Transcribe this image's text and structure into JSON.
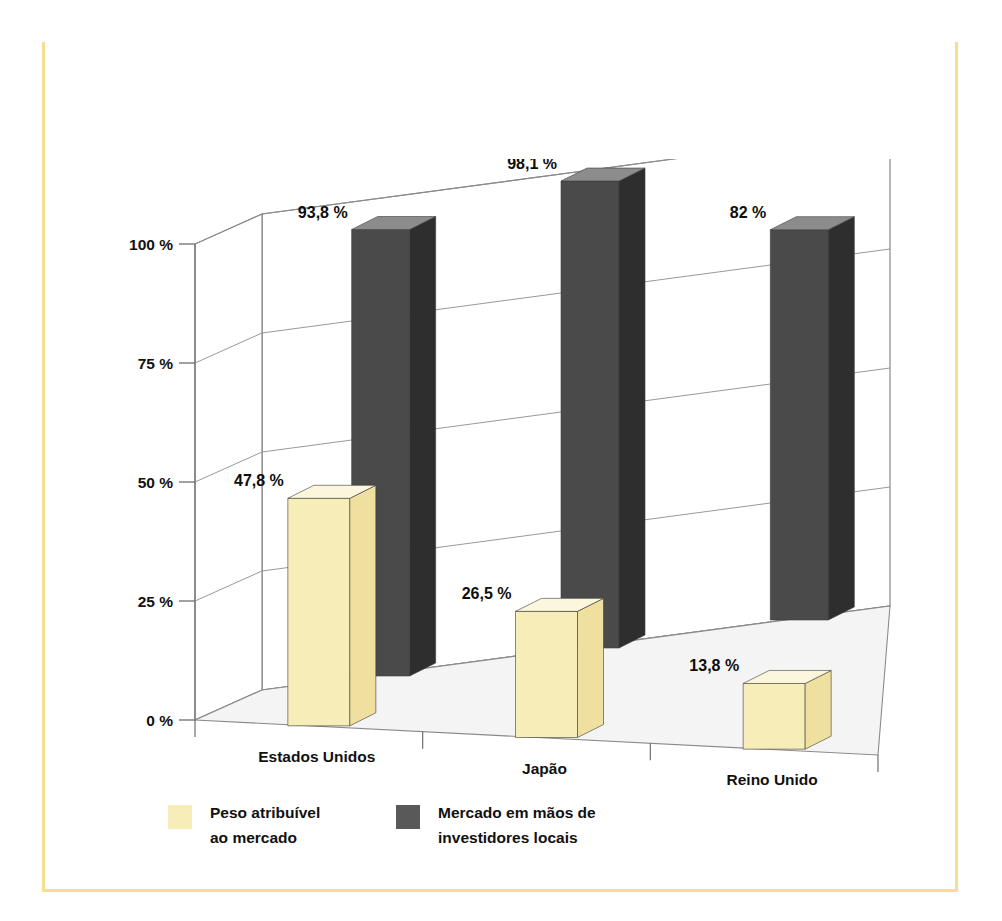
{
  "figure": {
    "caption_line1": "Figura 7.2 – Peso atribuível ao mercado acionário do país, em comparação com o mundo",
    "caption_line2": "inteiro (em primeiro plano); e percentual do mercado acionário do país em",
    "caption_line3": "mãos de investidores locais (em segundo plano)",
    "caption_band_color": "#F2CB55",
    "border_color": "#F7DD92"
  },
  "chart_data": {
    "type": "bar",
    "subtitle": "",
    "xlabel": "",
    "ylabel": "",
    "categories": [
      "Estados Unidos",
      "Japão",
      "Reino Unido"
    ],
    "ylim": [
      0,
      100
    ],
    "yticks": [
      0,
      25,
      50,
      75,
      100
    ],
    "ytick_labels": [
      "0 %",
      "25 %",
      "50 %",
      "75 %",
      "100 %"
    ],
    "grid": true,
    "grid_axis": "y",
    "legend_position": "bottom-left",
    "three_d": true,
    "series": [
      {
        "name": "Peso atribuível ao mercado",
        "color": "#F7EDB8",
        "side_color": "#EFE0A0",
        "top_color": "#FBF6DC",
        "values": [
          47.8,
          26.5,
          13.8
        ],
        "labels": [
          "47,8 %",
          "26,5 %",
          "13,8 %"
        ]
      },
      {
        "name": "Mercado em mãos de investidores locais",
        "color": "#4A4A4A",
        "side_color": "#2E2E2E",
        "top_color": "#8C8C8C",
        "values": [
          93.8,
          98.1,
          82.0
        ],
        "labels": [
          "93,8 %",
          "98,1 %",
          "82 %"
        ]
      }
    ]
  },
  "legend": {
    "items": [
      {
        "swatch_color": "#F7EDB8",
        "line1": "Peso atribuível",
        "line2": "ao mercado"
      },
      {
        "swatch_color": "#595959",
        "line1": "Mercado em mãos de",
        "line2": "investidores locais"
      }
    ]
  },
  "axes": {
    "y_tick_labels": [
      "100 %",
      "75 %",
      "50 %",
      "25 %",
      "0 %"
    ],
    "x_tick_labels": [
      "Estados Unidos",
      "Japão",
      "Reino Unido"
    ]
  }
}
